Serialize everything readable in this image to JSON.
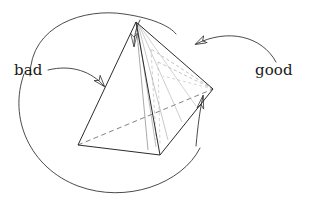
{
  "figure": {
    "name": "tetrahedron-sliver-diagram",
    "background_color": "#ffffff",
    "stroke_color": "#2b2b2b",
    "faint_stroke_color": "#8d8d8d",
    "width": 312,
    "height": 210
  },
  "labels": {
    "bad": "bad",
    "good": "good"
  },
  "shape": {
    "kind": "tetrahedron",
    "vertices": {
      "apex": [
        136,
        22
      ],
      "left": [
        78,
        145
      ],
      "bottom": [
        160,
        155
      ],
      "right": [
        213,
        89
      ]
    },
    "solid_edges": [
      "apex-left",
      "apex-bottom",
      "apex-right",
      "left-bottom",
      "bottom-right"
    ],
    "hidden_dashed_edges": [
      "left-right"
    ],
    "sliver_fan": {
      "from": "apex",
      "count": 5,
      "to_edge": "bottom-right",
      "description": "thin sliver subdivision lines fanning from the apex down to the bottom-right edge"
    },
    "dashed_interior_fan": {
      "from": "right",
      "count": 3,
      "description": "faint dashed lines from the right vertex into the interior"
    }
  },
  "annotations": [
    {
      "id": "bad-short-arrow",
      "label": "bad",
      "points_to": "left-face",
      "style": "curved-arrow"
    },
    {
      "id": "bad-long-arc",
      "label": "bad",
      "points_to": "apex-edge-top",
      "style": "large-sweeping-arc-arrow"
    },
    {
      "id": "good-top-arrow",
      "label": "good",
      "points_to": "sliver-region-upper",
      "style": "curved-arrow"
    },
    {
      "id": "good-lower-arc",
      "label": "good",
      "points_to": "sliver-region-right",
      "style": "large-sweeping-arc-arrow"
    }
  ]
}
